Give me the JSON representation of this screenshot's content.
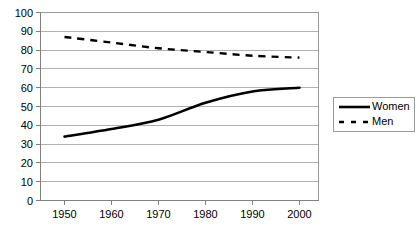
{
  "chart_data": {
    "type": "line",
    "title": "",
    "subtitle": "",
    "xlabel": "",
    "ylabel": "",
    "x": [
      1950,
      1960,
      1970,
      1980,
      1990,
      2000
    ],
    "categories": [
      "1950",
      "1960",
      "1970",
      "1980",
      "1990",
      "2000"
    ],
    "series": [
      {
        "name": "Women",
        "style": "solid",
        "color": "#000000",
        "values": [
          34,
          38,
          43,
          52,
          58,
          60
        ]
      },
      {
        "name": "Men",
        "style": "dashed",
        "color": "#000000",
        "values": [
          87,
          84,
          81,
          79,
          77,
          76
        ]
      }
    ],
    "xlim": [
      1945,
      2005
    ],
    "ylim": [
      0,
      100
    ],
    "ytick_labels": [
      "100",
      "90",
      "80",
      "70",
      "60",
      "50",
      "40",
      "30",
      "20",
      "10",
      "0"
    ],
    "ytick_values": [
      100,
      90,
      80,
      70,
      60,
      50,
      40,
      30,
      20,
      10,
      0
    ],
    "xtick_labels": [
      "1950",
      "1960",
      "1970",
      "1980",
      "1990",
      "2000"
    ],
    "grid": "horizontal",
    "grid_color": "#b0b0b0",
    "legend_position": "right",
    "legend_entries": [
      "Women",
      "Men"
    ],
    "background": "#ffffff"
  },
  "legend": {
    "women_label": "Women",
    "men_label": "Men"
  },
  "axes": {
    "y_labels": [
      "100",
      "90",
      "80",
      "70",
      "60",
      "50",
      "40",
      "30",
      "20",
      "10",
      "0"
    ],
    "x_labels": [
      "1950",
      "1960",
      "1970",
      "1980",
      "1990",
      "2000"
    ]
  }
}
